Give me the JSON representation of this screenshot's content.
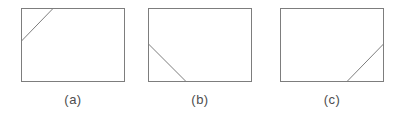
{
  "diagram": {
    "background": "#ffffff",
    "stroke_color": "#7d7d7d",
    "label_color": "#4d4d4d",
    "panel_width": 104,
    "panel_height": 74,
    "panels": [
      {
        "label": "(a)",
        "cut_corner": "top-left",
        "cut_line": {
          "x1": 32,
          "y1": 0.5,
          "x2": 0.5,
          "y2": 33
        }
      },
      {
        "label": "(b)",
        "cut_corner": "bottom-left",
        "cut_line": {
          "x1": 0.5,
          "y1": 36,
          "x2": 38,
          "y2": 73.5
        }
      },
      {
        "label": "(c)",
        "cut_corner": "bottom-right",
        "cut_line": {
          "x1": 67,
          "y1": 73.5,
          "x2": 103.5,
          "y2": 36
        }
      }
    ]
  }
}
